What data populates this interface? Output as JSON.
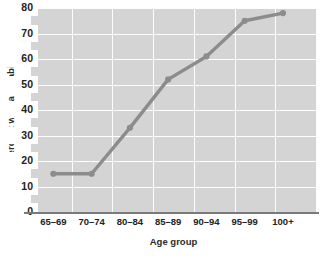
{
  "chart_data": {
    "type": "line",
    "title": "",
    "xlabel": "Age group",
    "ylabel": "Percent with a disability",
    "categories": [
      "65–69",
      "70–74",
      "80–84",
      "85–89",
      "90–94",
      "95–99",
      "100+"
    ],
    "values": [
      15,
      15,
      33,
      52,
      61,
      75,
      78
    ],
    "series": [
      {
        "name": "Percent with a disability",
        "values": [
          15,
          15,
          33,
          52,
          61,
          75,
          78
        ]
      }
    ],
    "ylim": [
      0,
      80
    ],
    "yticks": [
      0,
      10,
      20,
      30,
      40,
      50,
      60,
      70,
      80
    ],
    "ytick_labels": [
      "0",
      "10",
      "20",
      "30",
      "40",
      "50",
      "60",
      "70",
      "80"
    ],
    "grid": true,
    "legend": "none",
    "colors": {
      "line": "#8c8c8c",
      "marker": "#8c8c8c",
      "plot_background": "#d4d4d4",
      "gridline": "#fdfdfd",
      "axis_line": "#7a7a7a",
      "text": "#232323",
      "page_background": "#ffffff"
    }
  }
}
